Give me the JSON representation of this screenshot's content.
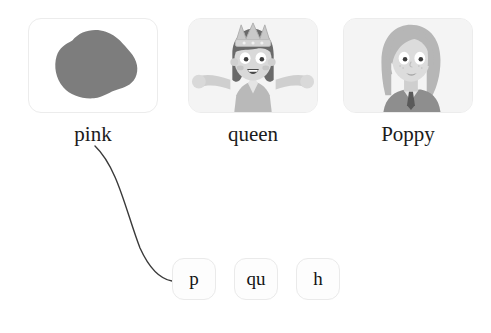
{
  "exercise": {
    "type": "phonics-matching",
    "cards": [
      {
        "id": "pink",
        "label": "pink",
        "picture": "pink-blob-icon",
        "x": 28,
        "y": 18
      },
      {
        "id": "queen",
        "label": "queen",
        "picture": "queen-character-icon",
        "x": 188,
        "y": 18
      },
      {
        "id": "poppy",
        "label": "Poppy",
        "picture": "poppy-character-icon",
        "x": 343,
        "y": 18
      }
    ],
    "tiles": [
      {
        "id": "p",
        "label": "p",
        "x": 172,
        "y": 258,
        "matched": true
      },
      {
        "id": "qu",
        "label": "qu",
        "x": 234,
        "y": 258,
        "matched": false
      },
      {
        "id": "h",
        "label": "h",
        "x": 296,
        "y": 258,
        "matched": false
      }
    ],
    "connection": {
      "from": "pink",
      "to": "p",
      "path": "M 95 146 C 118 168, 126 212, 140 248 C 150 270, 160 279, 172 281"
    }
  },
  "colors": {
    "card_border": "#ececec",
    "card_background": "#fbfbfb",
    "tile_border": "#eaeaea",
    "text": "#1b1b1b",
    "connector_line": "#3a3a3a",
    "blob_fill": "#7d7d7d",
    "skin": "#d9d9d9",
    "hair_dark": "#6a6a6a",
    "hair_light": "#c3c3c3"
  }
}
